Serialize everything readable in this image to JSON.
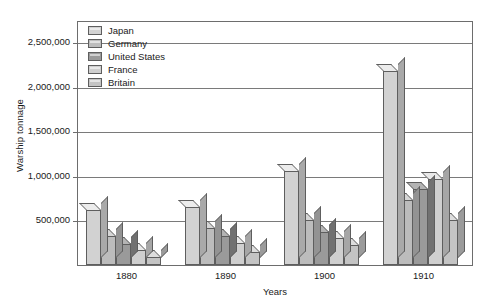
{
  "chart_data": {
    "type": "bar",
    "title": "",
    "subtitle": "",
    "xlabel": "Years",
    "ylabel": "Warship tonnage",
    "categories": [
      "1880",
      "1890",
      "1900",
      "1910"
    ],
    "ylim": [
      0,
      2500000
    ],
    "ytick_labels": [
      "500,000",
      "1,000,000",
      "1,500,000",
      "2,000,000",
      "2,500,000"
    ],
    "ytick_values": [
      500000,
      1000000,
      1500000,
      2000000,
      2500000
    ],
    "grid": true,
    "legend_position": "top-left",
    "style": "3d-grouped-bar",
    "series": [
      {
        "name": "Japan",
        "color": "#d2d2d2",
        "values": [
          620000,
          650000,
          1050000,
          2170000
        ]
      },
      {
        "name": "Germany",
        "color": "#bcbcbc",
        "values": [
          330000,
          420000,
          500000,
          730000
        ]
      },
      {
        "name": "United States",
        "color": "#9a9a9a",
        "values": [
          240000,
          330000,
          370000,
          855000
        ]
      },
      {
        "name": "France",
        "color": "#cfcfcf",
        "values": [
          170000,
          250000,
          300000,
          965000
        ]
      },
      {
        "name": "Britain",
        "color": "#c4c4c4",
        "values": [
          90000,
          150000,
          220000,
          500000
        ]
      }
    ]
  },
  "legend": {
    "items": [
      {
        "label": "Japan",
        "color": "#d2d2d2"
      },
      {
        "label": "Germany",
        "color": "#bcbcbc"
      },
      {
        "label": "United States",
        "color": "#9a9a9a"
      },
      {
        "label": "France",
        "color": "#cfcfcf"
      },
      {
        "label": "Britain",
        "color": "#c4c4c4"
      }
    ]
  },
  "caption": ""
}
